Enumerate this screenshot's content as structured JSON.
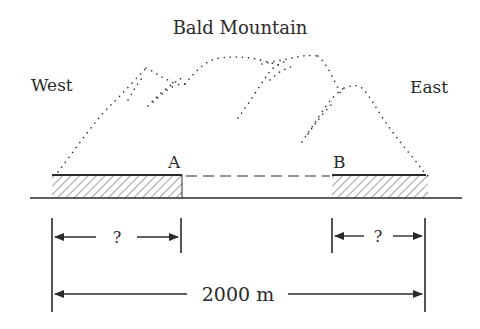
{
  "diagram": {
    "title": "Bald Mountain",
    "west_label": "West",
    "east_label": "East",
    "tunnel_a_label": "A",
    "tunnel_b_label": "B",
    "left_segment_label": "?",
    "right_segment_label": "?",
    "total_distance_label": "2000 m",
    "colors": {
      "ink": "#2a2a2a",
      "background": "#ffffff"
    }
  }
}
